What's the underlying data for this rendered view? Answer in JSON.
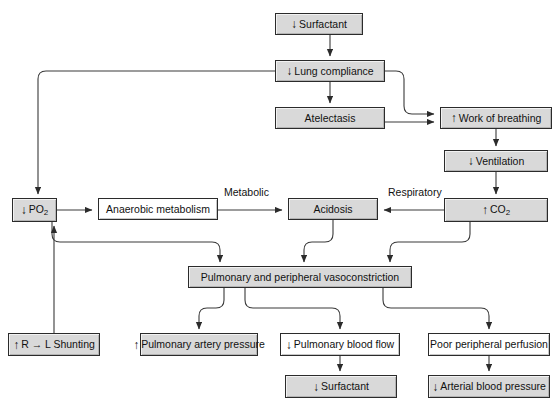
{
  "diagram": {
    "background": "#ffffff",
    "node_fill": "#d9d9d9",
    "node_border": "#2b2b2b",
    "line_color": "#3a3a3a",
    "nodes": [
      {
        "id": "surfactant_top",
        "label": "Surfactant",
        "arrow": "down",
        "x": 275,
        "y": 13,
        "w": 88,
        "h": 22,
        "style": "shaded"
      },
      {
        "id": "lung_compliance",
        "label": "Lung compliance",
        "arrow": "down",
        "x": 275,
        "y": 60,
        "w": 110,
        "h": 22,
        "style": "shaded"
      },
      {
        "id": "atelectasis",
        "label": "Atelectasis",
        "arrow": "none",
        "x": 275,
        "y": 107,
        "w": 110,
        "h": 22,
        "style": "shaded"
      },
      {
        "id": "work_breathing",
        "label": "Work of breathing",
        "arrow": "up",
        "x": 440,
        "y": 107,
        "w": 112,
        "h": 22,
        "style": "shaded"
      },
      {
        "id": "ventilation",
        "label": "Ventilation",
        "arrow": "down",
        "x": 444,
        "y": 150,
        "w": 104,
        "h": 22,
        "style": "shaded"
      },
      {
        "id": "co2",
        "label": "CO2",
        "arrow": "up",
        "x": 444,
        "y": 198,
        "w": 104,
        "h": 24,
        "style": "shaded"
      },
      {
        "id": "po2",
        "label": "PO2",
        "arrow": "down",
        "x": 12,
        "y": 198,
        "w": 45,
        "h": 24,
        "style": "shaded"
      },
      {
        "id": "anaerobic",
        "label": "Anaerobic metabolism",
        "arrow": "none",
        "x": 98,
        "y": 198,
        "w": 120,
        "h": 22,
        "style": "plain"
      },
      {
        "id": "acidosis",
        "label": "Acidosis",
        "arrow": "none",
        "x": 288,
        "y": 198,
        "w": 90,
        "h": 22,
        "style": "shaded"
      },
      {
        "id": "vasoconstriction",
        "label": "Pulmonary and peripheral vasoconstriction",
        "arrow": "none",
        "x": 188,
        "y": 266,
        "w": 224,
        "h": 22,
        "style": "shaded"
      },
      {
        "id": "shunting",
        "label": "R → L Shunting",
        "arrow": "up",
        "x": 8,
        "y": 333,
        "w": 92,
        "h": 23,
        "style": "shaded"
      },
      {
        "id": "pa_pressure",
        "label": "Pulmonary artery pressure",
        "arrow": "up",
        "x": 140,
        "y": 333,
        "w": 118,
        "h": 23,
        "style": "shaded"
      },
      {
        "id": "pbf",
        "label": "Pulmonary blood flow",
        "arrow": "down",
        "x": 280,
        "y": 333,
        "w": 120,
        "h": 23,
        "style": "plain"
      },
      {
        "id": "perfusion",
        "label": "Poor peripheral perfusion",
        "arrow": "none",
        "x": 428,
        "y": 333,
        "w": 122,
        "h": 23,
        "style": "plain"
      },
      {
        "id": "surfactant_bot",
        "label": "Surfactant",
        "arrow": "down",
        "x": 285,
        "y": 375,
        "w": 112,
        "h": 23,
        "style": "shaded"
      },
      {
        "id": "abp",
        "label": "Arterial blood pressure",
        "arrow": "down",
        "x": 428,
        "y": 375,
        "w": 122,
        "h": 23,
        "style": "shaded"
      }
    ],
    "edge_labels": [
      {
        "id": "metabolic",
        "text": "Metabolic",
        "x": 224,
        "y": 186
      },
      {
        "id": "respiratory",
        "text": "Respiratory",
        "x": 388,
        "y": 186
      }
    ],
    "edges": [
      {
        "id": "surfactant-to-compliance",
        "from": "surfactant_top",
        "to": "lung_compliance"
      },
      {
        "id": "compliance-to-atelectasis",
        "from": "lung_compliance",
        "to": "atelectasis"
      },
      {
        "id": "compliance-to-work",
        "from": "lung_compliance",
        "to": "work_breathing"
      },
      {
        "id": "atelectasis-to-work",
        "from": "atelectasis",
        "to": "work_breathing"
      },
      {
        "id": "compliance-to-po2",
        "from": "lung_compliance",
        "to": "po2"
      },
      {
        "id": "work-to-ventilation",
        "from": "work_breathing",
        "to": "ventilation"
      },
      {
        "id": "ventilation-to-co2",
        "from": "ventilation",
        "to": "co2"
      },
      {
        "id": "co2-to-acidosis",
        "from": "co2",
        "to": "acidosis"
      },
      {
        "id": "po2-to-anaerobic",
        "from": "po2",
        "to": "anaerobic"
      },
      {
        "id": "anaerobic-to-acidosis",
        "from": "anaerobic",
        "to": "acidosis"
      },
      {
        "id": "po2-to-vasoconstriction",
        "from": "po2",
        "to": "vasoconstriction"
      },
      {
        "id": "acidosis-to-vasoconstriction",
        "from": "acidosis",
        "to": "vasoconstriction"
      },
      {
        "id": "co2-to-vasoconstriction",
        "from": "co2",
        "to": "vasoconstriction"
      },
      {
        "id": "vaso-to-pa-pressure",
        "from": "vasoconstriction",
        "to": "pa_pressure"
      },
      {
        "id": "vaso-to-pbf",
        "from": "vasoconstriction",
        "to": "pbf"
      },
      {
        "id": "vaso-to-perfusion",
        "from": "vasoconstriction",
        "to": "perfusion"
      },
      {
        "id": "pbf-to-surfactant",
        "from": "pbf",
        "to": "surfactant_bot"
      },
      {
        "id": "perfusion-to-abp",
        "from": "perfusion",
        "to": "abp"
      },
      {
        "id": "shunting-to-po2",
        "from": "shunting",
        "to": "po2"
      }
    ]
  }
}
